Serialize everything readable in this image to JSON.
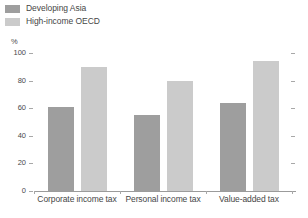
{
  "chart_data": {
    "type": "bar",
    "title": "",
    "subtitle": "",
    "xlabel": "",
    "ylabel": "%",
    "ylim": [
      0,
      100
    ],
    "yticks": [
      0,
      20,
      40,
      60,
      80,
      100
    ],
    "grid": false,
    "legend_position": "top-left",
    "categories": [
      "Corporate income tax",
      "Personal income tax",
      "Value-added tax"
    ],
    "series": [
      {
        "name": "Developing Asia",
        "color": "#9e9e9e",
        "values": [
          61,
          55,
          64
        ]
      },
      {
        "name": "High-income OECD",
        "color": "#cbcbcb",
        "values": [
          90,
          80,
          94
        ]
      }
    ]
  },
  "axis": {
    "unit_label": "%",
    "tick_labels": [
      "100",
      "80",
      "60",
      "40",
      "20",
      "0"
    ]
  },
  "colors": {
    "series_1": "#9e9e9e",
    "series_2": "#cbcbcb",
    "axis": "#9b9b9b",
    "text": "#464646",
    "background": "#ffffff"
  }
}
